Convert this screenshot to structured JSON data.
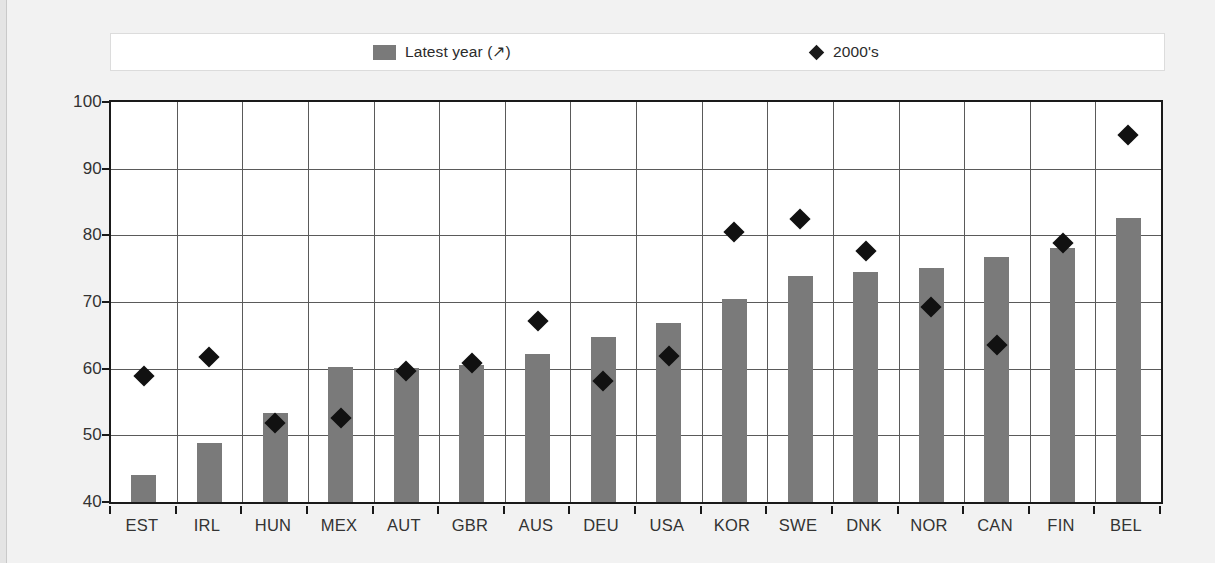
{
  "legend": {
    "entries": [
      {
        "label": "Latest year (↗)",
        "marker": "square",
        "color": "#7a7a7a"
      },
      {
        "label": "2000's",
        "marker": "diamond",
        "color": "#111111"
      }
    ]
  },
  "chart_data": {
    "type": "bar",
    "title": "",
    "xlabel": "",
    "ylabel": "",
    "ylim": [
      40,
      100
    ],
    "ytick_step": 10,
    "yticks": [
      40,
      50,
      60,
      70,
      80,
      90,
      100
    ],
    "grid": true,
    "legend_position": "top",
    "categories": [
      "EST",
      "IRL",
      "HUN",
      "MEX",
      "AUT",
      "GBR",
      "AUS",
      "DEU",
      "USA",
      "KOR",
      "SWE",
      "DNK",
      "NOR",
      "CAN",
      "FIN",
      "BEL"
    ],
    "series": [
      {
        "name": "Latest year (↗)",
        "type": "bar",
        "color": "#7a7a7a",
        "values": [
          44.0,
          48.9,
          53.3,
          60.3,
          60.1,
          60.5,
          62.2,
          64.7,
          66.9,
          70.4,
          73.9,
          74.5,
          75.1,
          76.8,
          78.1,
          82.6
        ]
      },
      {
        "name": "2000's",
        "type": "scatter",
        "color": "#111111",
        "marker": "diamond",
        "values": [
          58.9,
          61.8,
          51.8,
          52.6,
          59.6,
          60.8,
          67.2,
          58.2,
          61.9,
          80.5,
          82.4,
          77.6,
          69.3,
          63.5,
          78.8,
          95.0
        ]
      }
    ]
  }
}
